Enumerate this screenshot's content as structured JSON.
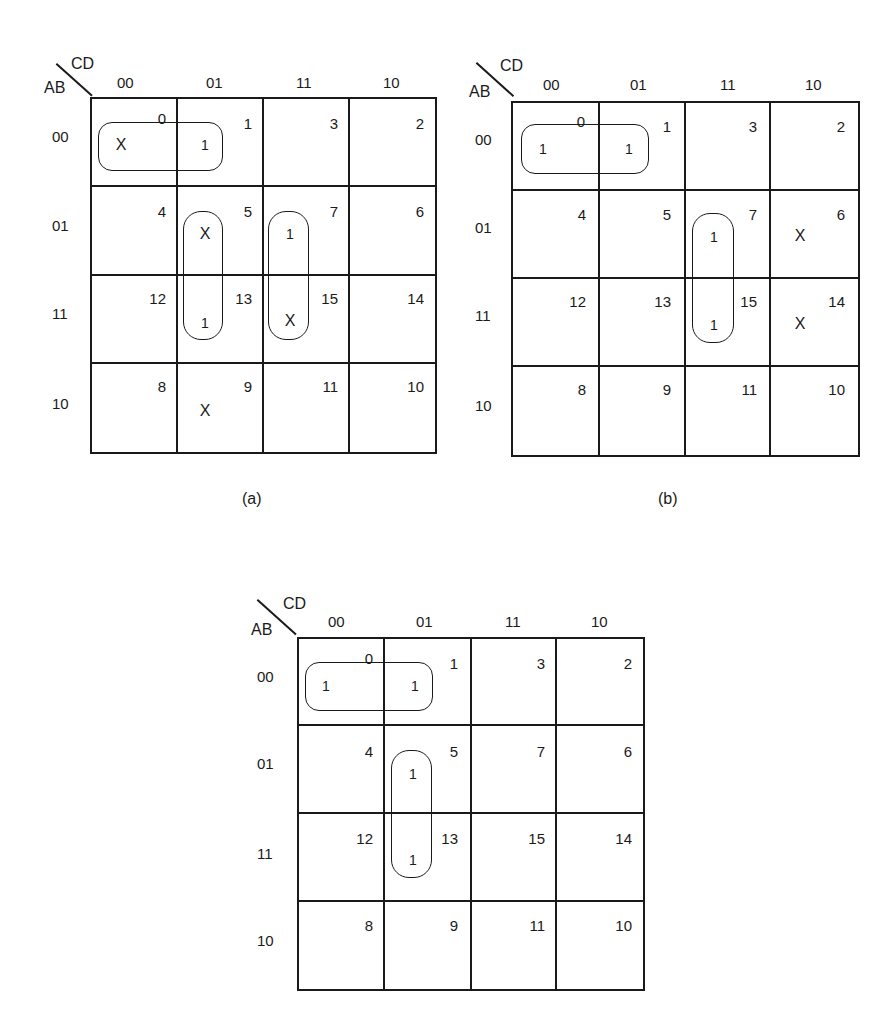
{
  "maps": [
    {
      "id": "a",
      "caption": "(a)",
      "row_var": "AB",
      "col_var": "CD",
      "col_labels": [
        "00",
        "01",
        "11",
        "10"
      ],
      "row_labels": [
        "00",
        "01",
        "11",
        "10"
      ],
      "minterms": [
        [
          0,
          1,
          3,
          2
        ],
        [
          4,
          5,
          7,
          6
        ],
        [
          12,
          13,
          15,
          14
        ],
        [
          8,
          9,
          11,
          10
        ]
      ],
      "values": [
        [
          "X",
          "1",
          "",
          ""
        ],
        [
          "",
          "X",
          "1",
          ""
        ],
        [
          "",
          "1",
          "X",
          ""
        ],
        [
          "",
          "X",
          "",
          ""
        ]
      ],
      "loops": [
        [
          "m0",
          "m1"
        ],
        [
          "m5",
          "m13"
        ],
        [
          "m7",
          "m15"
        ]
      ]
    },
    {
      "id": "b",
      "caption": "(b)",
      "row_var": "AB",
      "col_var": "CD",
      "col_labels": [
        "00",
        "01",
        "11",
        "10"
      ],
      "row_labels": [
        "00",
        "01",
        "11",
        "10"
      ],
      "minterms": [
        [
          0,
          1,
          3,
          2
        ],
        [
          4,
          5,
          7,
          6
        ],
        [
          12,
          13,
          15,
          14
        ],
        [
          8,
          9,
          11,
          10
        ]
      ],
      "values": [
        [
          "1",
          "1",
          "",
          ""
        ],
        [
          "",
          "",
          "1",
          "X"
        ],
        [
          "",
          "",
          "1",
          "X"
        ],
        [
          "",
          "",
          "",
          ""
        ]
      ],
      "loops": [
        [
          "m0",
          "m1"
        ],
        [
          "m7",
          "m15"
        ]
      ]
    },
    {
      "id": "c",
      "caption": "",
      "row_var": "AB",
      "col_var": "CD",
      "col_labels": [
        "00",
        "01",
        "11",
        "10"
      ],
      "row_labels": [
        "00",
        "01",
        "11",
        "10"
      ],
      "minterms": [
        [
          0,
          1,
          3,
          2
        ],
        [
          4,
          5,
          7,
          6
        ],
        [
          12,
          13,
          15,
          14
        ],
        [
          8,
          9,
          11,
          10
        ]
      ],
      "values": [
        [
          "1",
          "1",
          "",
          ""
        ],
        [
          "",
          "1",
          "",
          ""
        ],
        [
          "",
          "1",
          "",
          ""
        ],
        [
          "",
          "",
          "",
          ""
        ]
      ],
      "loops": [
        [
          "m0",
          "m1"
        ],
        [
          "m5",
          "m13"
        ]
      ]
    }
  ]
}
